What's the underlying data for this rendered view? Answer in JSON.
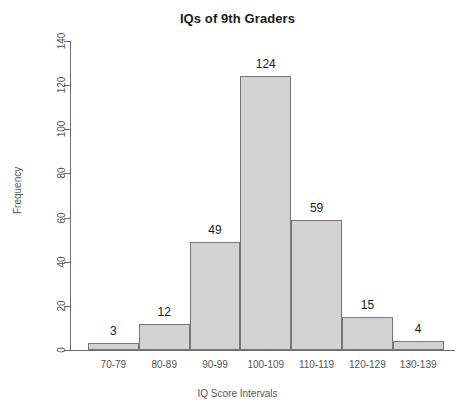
{
  "chart_data": {
    "type": "bar",
    "title": "IQs of 9th Graders",
    "xlabel": "IQ Score Intervals",
    "ylabel": "Frequency",
    "categories": [
      "70-79",
      "80-89",
      "90-99",
      "100-109",
      "110-119",
      "120-129",
      "130-139"
    ],
    "values": [
      3,
      12,
      49,
      124,
      59,
      15,
      4
    ],
    "data_labels": [
      "3",
      "12",
      "49",
      "124",
      "59",
      "15",
      "4"
    ],
    "ylim": [
      0,
      140
    ],
    "yticks": [
      0,
      20,
      40,
      60,
      80,
      100,
      120,
      140
    ],
    "ytick_labels": [
      "0",
      "20",
      "40",
      "60",
      "80",
      "100",
      "120",
      "140"
    ],
    "grid": false,
    "legend": null,
    "bar_fill_color": "#d2d2d2",
    "bar_border_color": "#767676",
    "axis_color": "#6b6b6b",
    "text_color": "#555555",
    "title_color": "#1a1a1a",
    "background_color": "#ffffff"
  }
}
